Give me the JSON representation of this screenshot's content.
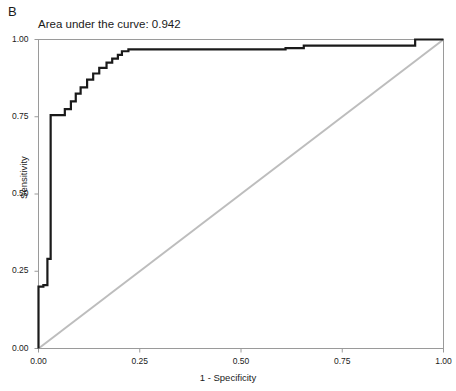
{
  "figure": {
    "panel_label": "B",
    "title": "Area under the curve: 0.942",
    "background_color": "#ffffff"
  },
  "axes": {
    "y_axis_title": "Sensitivity",
    "x_axis_title": "1 - Specificity",
    "y_ticks": [
      "1.00",
      "0.75",
      "0.50",
      "0.25",
      "0.00"
    ],
    "x_ticks": [
      "0.00",
      "0.25",
      "0.50",
      "0.75",
      "1.00"
    ]
  },
  "colors": {
    "roc_curve": "#1a1a1a",
    "reference_line": "#bdbdbd",
    "frame": "#9a9a9a",
    "text": "#1a1a1a"
  },
  "chart_data": {
    "type": "line",
    "title": "Area under the curve: 0.942",
    "xlabel": "1 - Specificity",
    "ylabel": "Sensitivity",
    "xlim": [
      0.0,
      1.0
    ],
    "ylim": [
      0.0,
      1.0
    ],
    "grid": false,
    "legend": "none",
    "auc": 0.942,
    "annotations": [
      "B",
      "Area under the curve: 0.942"
    ],
    "series": [
      {
        "name": "ROC curve",
        "style": "step",
        "color": "#1a1a1a",
        "linewidth": 2.2,
        "x": [
          0.0,
          0.0,
          0.012,
          0.012,
          0.022,
          0.022,
          0.03,
          0.03,
          0.065,
          0.065,
          0.08,
          0.08,
          0.092,
          0.092,
          0.104,
          0.104,
          0.12,
          0.12,
          0.135,
          0.135,
          0.15,
          0.15,
          0.168,
          0.168,
          0.182,
          0.182,
          0.196,
          0.196,
          0.206,
          0.206,
          0.222,
          0.222,
          0.61,
          0.61,
          0.655,
          0.655,
          0.93,
          0.93,
          1.0
        ],
        "y": [
          0.0,
          0.2,
          0.2,
          0.205,
          0.205,
          0.29,
          0.29,
          0.755,
          0.755,
          0.775,
          0.775,
          0.8,
          0.8,
          0.825,
          0.825,
          0.845,
          0.845,
          0.87,
          0.87,
          0.89,
          0.89,
          0.908,
          0.908,
          0.925,
          0.925,
          0.938,
          0.938,
          0.95,
          0.95,
          0.962,
          0.962,
          0.968,
          0.968,
          0.972,
          0.972,
          0.98,
          0.98,
          1.0,
          1.0
        ]
      },
      {
        "name": "Reference line",
        "style": "line",
        "color": "#bdbdbd",
        "linewidth": 2.0,
        "x": [
          0.0,
          1.0
        ],
        "y": [
          0.0,
          1.0
        ]
      }
    ]
  }
}
